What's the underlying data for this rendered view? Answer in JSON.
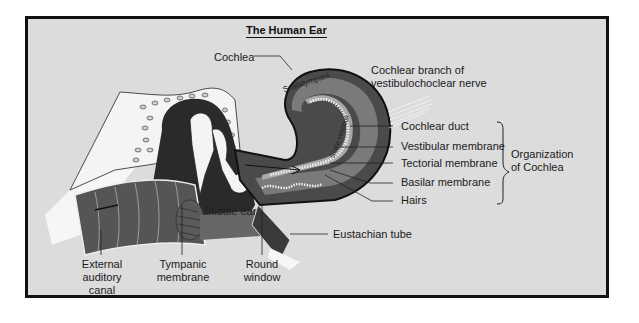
{
  "title": "The Human Ear",
  "colors": {
    "background": "#dcdcdc",
    "frame": "#111111",
    "tissue_dark": "#4a4a4a",
    "tissue_mid": "#6e6e6e",
    "tissue_light": "#9a9a9a",
    "bone": "#f2f2f2"
  },
  "labels": {
    "cochlea": "Cochlea",
    "nerve_line1": "Cochlear branch of",
    "nerve_line2": "vestibulochoclear nerve",
    "cochlear_duct": "Cochlear duct",
    "vestibular_membrane": "Vestibular membrane",
    "tectorial_membrane": "Tectorial membrane",
    "basilar_membrane": "Basilar membrane",
    "hairs": "Hairs",
    "organization_line1": "Organization",
    "organization_line2": "of Cochlea",
    "eustachian_tube": "Eustachian tube",
    "middle_ear": "Middle ear",
    "scala_tympani": "Scalatympani",
    "scala_vestibuli": "Scala vestibuli",
    "external_line1": "External",
    "external_line2": "auditory",
    "external_line3": "canal",
    "tympanic_line1": "Tympanic",
    "tympanic_line2": "membrane",
    "round_line1": "Round",
    "round_line2": "window"
  }
}
